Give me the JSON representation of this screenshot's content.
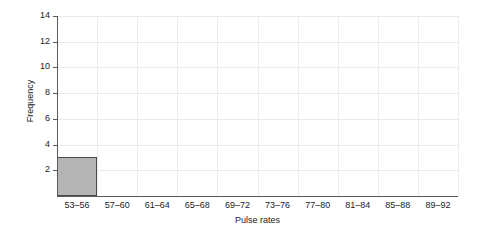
{
  "chart_data": {
    "type": "bar",
    "title": "",
    "xlabel": "Pulse rates",
    "ylabel": "Frequency",
    "categories": [
      "53–56",
      "57–60",
      "61–64",
      "65–68",
      "69–72",
      "73–76",
      "77–80",
      "81–84",
      "85–88",
      "89–92"
    ],
    "values": [
      3,
      0,
      0,
      0,
      0,
      0,
      0,
      0,
      0,
      0
    ],
    "ylim": [
      0,
      14
    ],
    "ytick_labels": [
      "2",
      "4",
      "6",
      "8",
      "10",
      "12",
      "14"
    ],
    "ytick_values": [
      2,
      4,
      6,
      8,
      10,
      12,
      14
    ],
    "grid": true,
    "legend": false,
    "bar_fill_color": "#b4b4b4",
    "bar_border_color": "#4a4a4a",
    "grid_color": "#e9e9e9",
    "axis_color": "#5a5a5a",
    "text_color": "#222222",
    "background_color": "#ffffff"
  }
}
